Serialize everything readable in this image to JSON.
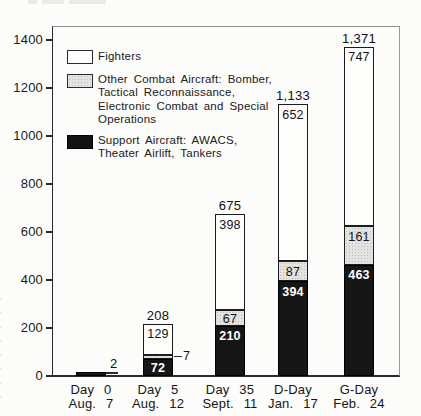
{
  "chart_data": {
    "type": "bar",
    "stacked": true,
    "title": "",
    "xlabel": "",
    "ylabel": "",
    "ylim": [
      0,
      1450
    ],
    "grid": false,
    "legend_position": "top-left-inside",
    "yticks": [
      0,
      200,
      400,
      600,
      800,
      1000,
      1200,
      1400
    ],
    "ytick_labels": [
      "0",
      "200",
      "400",
      "600",
      "800",
      "1000",
      "1200",
      "1400"
    ],
    "categories": [
      "Day 0 Aug. 7",
      "Day 5 Aug. 12",
      "Day 35 Sept. 11",
      "D-Day Jan. 17",
      "G-Day Feb. 24"
    ],
    "series": [
      {
        "name": "Support Aircraft: AWACS, Theater Airlift, Tankers",
        "key": "support",
        "color": "#161616",
        "values": [
          2,
          72,
          210,
          394,
          463
        ]
      },
      {
        "name": "Other Combat Aircraft: Bomber, Tactical Reconnaissance, Electronic Combat and Special Operations",
        "key": "other",
        "color": "#e3e3e1",
        "values": [
          0,
          7,
          67,
          87,
          161
        ]
      },
      {
        "name": "Fighters",
        "key": "fighters",
        "color": "#fdfdfc",
        "values": [
          0,
          129,
          398,
          652,
          747
        ]
      }
    ],
    "totals": [
      2,
      208,
      675,
      1133,
      1371
    ],
    "legend": [
      {
        "key": "fighters",
        "lines": [
          "Fighters"
        ]
      },
      {
        "key": "other",
        "lines": [
          "Other Combat Aircraft: Bomber,",
          "Tactical Reconnaissance,",
          "Electronic Combat and Special",
          "Operations"
        ]
      },
      {
        "key": "support",
        "lines": [
          "Support Aircraft: AWACS,",
          "Theater Airlift, Tankers"
        ]
      }
    ],
    "bars": [
      {
        "category_lines": [
          "Day 0",
          "Aug. 7"
        ],
        "total": {
          "text": "2",
          "placement": "right"
        },
        "segments": [
          {
            "key": "support",
            "value": 2,
            "label": "",
            "label_placement": "none"
          }
        ]
      },
      {
        "category_lines": [
          "Day 5",
          "Aug. 12"
        ],
        "total": {
          "text": "208",
          "placement": "above"
        },
        "segments": [
          {
            "key": "support",
            "value": 72,
            "label": "72",
            "label_placement": "center"
          },
          {
            "key": "other",
            "value": 7,
            "label": "7",
            "label_placement": "callout"
          },
          {
            "key": "fighters",
            "value": 129,
            "label": "129",
            "label_placement": "top"
          }
        ]
      },
      {
        "category_lines": [
          "Day 35",
          "Sept. 11"
        ],
        "total": {
          "text": "675",
          "placement": "above"
        },
        "segments": [
          {
            "key": "support",
            "value": 210,
            "label": "210",
            "label_placement": "top"
          },
          {
            "key": "other",
            "value": 67,
            "label": "67",
            "label_placement": "center"
          },
          {
            "key": "fighters",
            "value": 398,
            "label": "398",
            "label_placement": "top"
          }
        ]
      },
      {
        "category_lines": [
          "D-Day",
          "Jan. 17"
        ],
        "total": {
          "text": "1,133",
          "placement": "above"
        },
        "segments": [
          {
            "key": "support",
            "value": 394,
            "label": "394",
            "label_placement": "top"
          },
          {
            "key": "other",
            "value": 87,
            "label": "87",
            "label_placement": "center"
          },
          {
            "key": "fighters",
            "value": 652,
            "label": "652",
            "label_placement": "top"
          }
        ]
      },
      {
        "category_lines": [
          "G-Day",
          "Feb. 24"
        ],
        "total": {
          "text": "1,371",
          "placement": "above"
        },
        "segments": [
          {
            "key": "support",
            "value": 463,
            "label": "463",
            "label_placement": "top"
          },
          {
            "key": "other",
            "value": 161,
            "label": "161",
            "label_placement": "top"
          },
          {
            "key": "fighters",
            "value": 747,
            "label": "747",
            "label_placement": "top"
          }
        ]
      }
    ],
    "colors": {
      "fighters": "#fdfdfc",
      "other": "#e3e3e1",
      "support": "#161616",
      "axis": "#2a2a2a"
    }
  }
}
